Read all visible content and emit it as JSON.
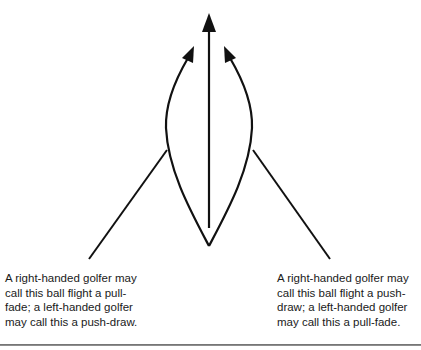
{
  "diagram": {
    "paths": [
      {
        "id": "left-curve",
        "description": "Curving flight path bending left then up"
      },
      {
        "id": "straight",
        "description": "Straight flight path"
      },
      {
        "id": "right-curve",
        "description": "Curving flight path bending right then up"
      }
    ],
    "stroke_color": "#111111"
  },
  "captions": {
    "left": "A right-handed golfer may call this ball flight a pull-fade; a left-handed golfer may call this a push-draw.",
    "right": "A right-handed golfer may call this ball flight a push-draw; a left-handed golfer may call this a pull-fade."
  }
}
